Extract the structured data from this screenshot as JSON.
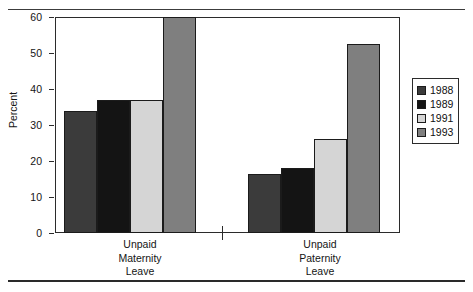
{
  "chart_data": {
    "type": "bar",
    "title": "",
    "xlabel": "",
    "ylabel": "Percent",
    "ylim": [
      0,
      60
    ],
    "yticks": [
      "0",
      "10",
      "20",
      "30",
      "40",
      "50",
      "60"
    ],
    "grid": false,
    "legend_position": "right",
    "categories": [
      "Unpaid\nMaternity\nLeave",
      "Unpaid\nPaternity\nLeave"
    ],
    "series": [
      {
        "name": "1988",
        "color": "#3b3b3b",
        "values": [
          34.0,
          16.4
        ]
      },
      {
        "name": "1989",
        "color": "#141414",
        "values": [
          37.0,
          18.0
        ]
      },
      {
        "name": "1991",
        "color": "#d5d5d5",
        "values": [
          37.0,
          26.0
        ]
      },
      {
        "name": "1993",
        "color": "#7f7f7f",
        "values": [
          60.0,
          52.5
        ]
      }
    ]
  },
  "axis": {
    "y_label": "Percent",
    "y_ticks": [
      {
        "label": "60",
        "value": 60
      },
      {
        "label": "50",
        "value": 50
      },
      {
        "label": "40",
        "value": 40
      },
      {
        "label": "30",
        "value": 30
      },
      {
        "label": "20",
        "value": 20
      },
      {
        "label": "10",
        "value": 10
      },
      {
        "label": "0",
        "value": 0
      }
    ],
    "x_groups": [
      {
        "label": "Unpaid\nMaternity\nLeave"
      },
      {
        "label": "Unpaid\nPaternity\nLeave"
      }
    ]
  },
  "legend": {
    "items": [
      {
        "label": "1988",
        "color": "#3b3b3b"
      },
      {
        "label": "1989",
        "color": "#141414"
      },
      {
        "label": "1991",
        "color": "#d5d5d5"
      },
      {
        "label": "1993",
        "color": "#7f7f7f"
      }
    ]
  }
}
